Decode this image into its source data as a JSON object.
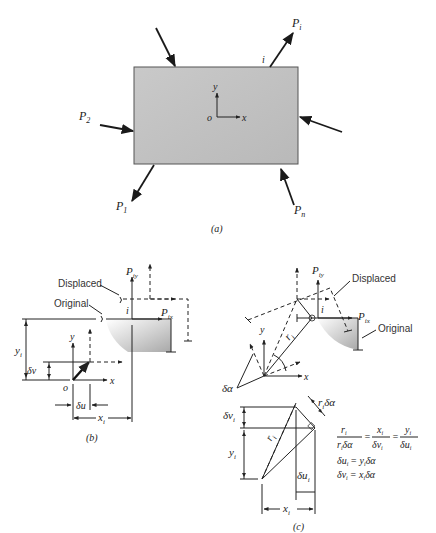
{
  "figure": {
    "panel_a": {
      "caption": "(a)",
      "labels": {
        "P1": "P",
        "P1_sub": "1",
        "P2": "P",
        "P2_sub": "2",
        "Pi": "P",
        "Pi_sub": "i",
        "Pn": "P",
        "Pn_sub": "n",
        "node_i": "i",
        "origin": "o",
        "x": "x",
        "y": "y"
      },
      "colors": {
        "plate_fill": "#c8c8c8",
        "plate_edge": "#555555"
      }
    },
    "panel_b": {
      "caption": "(b)",
      "labels": {
        "displaced": "Displaced",
        "original": "Original",
        "Piy": "P",
        "Piy_sub": "iy",
        "Pix": "P",
        "Pix_sub": "ix",
        "node_i": "i",
        "yi": "y",
        "yi_sub": "i",
        "xi": "x",
        "xi_sub": "i",
        "dv": "δv",
        "du": "δu",
        "origin": "o",
        "x": "x",
        "y": "y"
      }
    },
    "panel_c": {
      "caption": "(c)",
      "labels": {
        "displaced": "Displaced",
        "original": "Original",
        "Piy": "P",
        "Piy_sub": "iy",
        "Pix": "P",
        "Pix_sub": "ix",
        "node_i": "i",
        "ri": "r",
        "ri_sub": "i",
        "dalpha": "δα",
        "x": "x",
        "y": "y",
        "ri_dalpha": "r",
        "ri_dalpha_tail": "δα",
        "dvi": "δv",
        "dvi_sub": "i",
        "yi": "y",
        "yi_sub": "i",
        "dui": "δu",
        "dui_sub": "i",
        "xi": "x",
        "xi_sub": "i"
      },
      "equations": {
        "ratio_lhs_num": "r",
        "ratio_lhs_den": "r",
        "ratio_lhs_den_tail": "δα",
        "ratio_mid_num": "x",
        "ratio_mid_den": "δv",
        "ratio_rhs_num": "y",
        "ratio_rhs_den": "δu",
        "eq_sign": "=",
        "eq2": "δu",
        "eq2_rhs": "= y",
        "eq2_tail": "δα",
        "eq3": "δv",
        "eq3_rhs": "= x",
        "eq3_tail": "δα",
        "sub_i": "i"
      }
    }
  }
}
